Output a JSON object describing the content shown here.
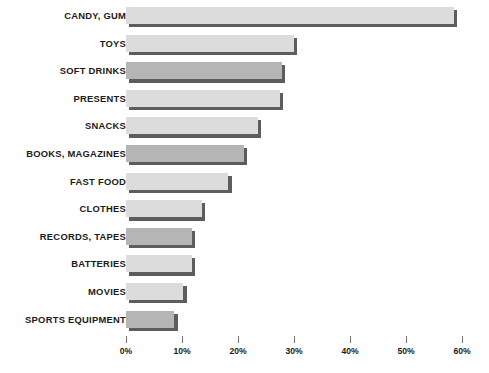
{
  "chart_data": {
    "type": "bar",
    "orientation": "horizontal",
    "title": "",
    "subtitle": "",
    "xlabel": "",
    "ylabel": "",
    "xlim": [
      0,
      60
    ],
    "grid": false,
    "legend": null,
    "tick_suffix": "%",
    "xticks": [
      0,
      10,
      20,
      30,
      40,
      50,
      60
    ],
    "xtick_labels": [
      "0%",
      "10%",
      "20%",
      "30%",
      "40%",
      "50%",
      "60%"
    ],
    "categories": [
      "CANDY, GUM",
      "TOYS",
      "SOFT DRINKS",
      "PRESENTS",
      "SNACKS",
      "BOOKS, MAGAZINES",
      "FAST FOOD",
      "CLOTHES",
      "RECORDS, TAPES",
      "BATTERIES",
      "MOVIES",
      "SPORTS EQUIPMENT"
    ],
    "values": [
      58.5,
      30.0,
      27.8,
      27.5,
      23.5,
      21.0,
      18.3,
      13.5,
      11.8,
      11.8,
      10.2,
      8.6
    ],
    "bar_shades": [
      "light",
      "light",
      "dark",
      "light",
      "light",
      "dark",
      "light",
      "light",
      "dark",
      "light",
      "light",
      "dark"
    ],
    "colors": {
      "bar_light": "#dcdcdc",
      "bar_dark": "#b5b5b5",
      "bar_shadow": "#5d5d5d",
      "text": "#1b1b1b",
      "tick": "#6f6f6f",
      "background": "#ffffff"
    }
  }
}
